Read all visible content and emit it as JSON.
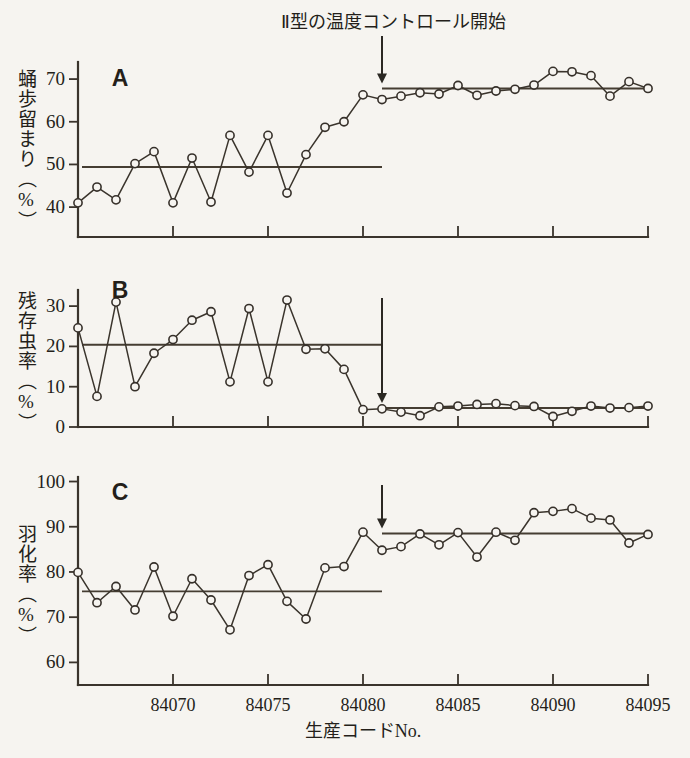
{
  "figure": {
    "annotation": "Ⅱ型の温度コントロール開始",
    "xlabel": "生産コードNo.",
    "background_color": "#f6f4f0",
    "ink_color": "#3a342c"
  },
  "chart_data": [
    {
      "type": "line",
      "panel": "A",
      "title": "",
      "ylabel": "蛹歩留まり（%）",
      "xlabel": "生産コードNo.",
      "ylim": [
        33,
        74
      ],
      "yticks": [
        40,
        50,
        60,
        70
      ],
      "xlim": [
        84065,
        84095
      ],
      "xticks": [
        84070,
        84075,
        84080,
        84085,
        84090,
        84095
      ],
      "grid": false,
      "legend": "none",
      "mean_before": 49.4,
      "mean_after": 67.8,
      "intervention_x": 84081,
      "x": [
        84065,
        84066,
        84067,
        84068,
        84069,
        84070,
        84071,
        84072,
        84073,
        84074,
        84075,
        84076,
        84077,
        84078,
        84079,
        84080,
        84081,
        84082,
        84083,
        84084,
        84085,
        84086,
        84087,
        84088,
        84089,
        84090,
        84091,
        84092,
        84093,
        84094,
        84095
      ],
      "values": [
        41.0,
        44.7,
        41.7,
        50.2,
        53.0,
        41.0,
        51.5,
        41.2,
        56.8,
        48.2,
        56.8,
        43.3,
        52.3,
        58.7,
        60.0,
        66.3,
        65.2,
        66.0,
        66.8,
        66.5,
        68.5,
        66.2,
        67.2,
        67.6,
        68.6,
        71.8,
        71.7,
        70.8,
        66.0,
        69.4,
        67.8
      ]
    },
    {
      "type": "line",
      "panel": "B",
      "title": "",
      "ylabel": "残存虫率（%）",
      "xlabel": "生産コードNo.",
      "ylim": [
        0,
        34
      ],
      "yticks": [
        0,
        10,
        20,
        30
      ],
      "xlim": [
        84065,
        84095
      ],
      "xticks": [
        84070,
        84075,
        84080,
        84085,
        84090,
        84095
      ],
      "grid": false,
      "legend": "none",
      "mean_before": 20.4,
      "mean_after": 4.7,
      "intervention_x": 84081,
      "x": [
        84065,
        84066,
        84067,
        84068,
        84069,
        84070,
        84071,
        84072,
        84073,
        84074,
        84075,
        84076,
        84077,
        84078,
        84079,
        84080,
        84081,
        84082,
        84083,
        84084,
        84085,
        84086,
        84087,
        84088,
        84089,
        84090,
        84091,
        84092,
        84093,
        84094,
        84095
      ],
      "values": [
        24.6,
        7.6,
        31.0,
        10.0,
        18.3,
        21.7,
        26.5,
        28.6,
        11.2,
        29.4,
        11.2,
        31.5,
        19.3,
        19.4,
        14.3,
        4.3,
        4.5,
        3.7,
        2.8,
        5.0,
        5.2,
        5.6,
        5.8,
        5.3,
        5.1,
        2.6,
        3.9,
        5.2,
        4.7,
        4.8,
        5.2
      ]
    },
    {
      "type": "line",
      "panel": "C",
      "title": "",
      "ylabel": "羽化率（%）",
      "xlabel": "生産コードNo.",
      "ylim": [
        55,
        101
      ],
      "yticks": [
        60,
        70,
        80,
        90,
        100
      ],
      "xlim": [
        84065,
        84095
      ],
      "xticks": [
        84070,
        84075,
        84080,
        84085,
        84090,
        84095
      ],
      "grid": false,
      "legend": "none",
      "mean_before": 75.7,
      "mean_after": 88.5,
      "intervention_x": 84081,
      "x": [
        84065,
        84066,
        84067,
        84068,
        84069,
        84070,
        84071,
        84072,
        84073,
        84074,
        84075,
        84076,
        84077,
        84078,
        84079,
        84080,
        84081,
        84082,
        84083,
        84084,
        84085,
        84086,
        84087,
        84088,
        84089,
        84090,
        84091,
        84092,
        84093,
        84094,
        84095
      ],
      "values": [
        79.9,
        73.2,
        76.8,
        71.6,
        81.1,
        70.2,
        78.5,
        73.8,
        67.2,
        79.2,
        81.6,
        73.5,
        69.6,
        80.9,
        81.2,
        88.8,
        84.8,
        85.6,
        88.4,
        86.0,
        88.7,
        83.3,
        88.8,
        87.0,
        93.1,
        93.4,
        94.0,
        91.9,
        91.5,
        86.4,
        88.3
      ]
    }
  ],
  "panels": [
    {
      "letter": "A",
      "ylabel_text": "蛹歩留まり（%）",
      "tick_labels": [
        "70",
        "60",
        "50",
        "40"
      ]
    },
    {
      "letter": "B",
      "ylabel_text": "残存虫率（%）",
      "tick_labels": [
        "30",
        "20",
        "10",
        "0"
      ]
    },
    {
      "letter": "C",
      "ylabel_text": "羽化率（%）",
      "tick_labels": [
        "100",
        "90",
        "80",
        "70",
        "60"
      ]
    }
  ],
  "xaxis": {
    "tick_labels": [
      "84070",
      "84075",
      "84080",
      "84085",
      "84090",
      "84095"
    ],
    "title": "生産コードNo."
  }
}
